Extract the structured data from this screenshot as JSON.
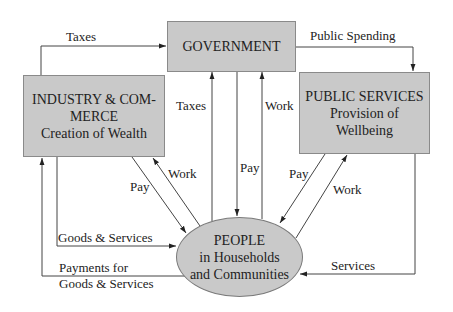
{
  "nodes": {
    "government": {
      "title": "GOVERNMENT"
    },
    "industry": {
      "line1": "INDUSTRY & COM-",
      "line2": "MERCE",
      "line3": "Creation of Wealth"
    },
    "public_services": {
      "line1": "PUBLIC SERVICES",
      "line2": "Provision of",
      "line3": "Wellbeing"
    },
    "people": {
      "line1": "PEOPLE",
      "line2": "in Households",
      "line3": "and Communities"
    }
  },
  "edges": {
    "industry_taxes": "Taxes",
    "public_spending": "Public Spending",
    "people_taxes": "Taxes",
    "gov_pay": "Pay",
    "people_work_gov": "Work",
    "industry_pay": "Pay",
    "industry_work": "Work",
    "ps_pay": "Pay",
    "ps_work": "Work",
    "goods_services": "Goods & Services",
    "payments_line1": "Payments for",
    "payments_line2": "Goods & Services",
    "services": "Services"
  },
  "colors": {
    "box_fill": "#c9c9c9",
    "box_border": "#8a8a8a",
    "line": "#333333",
    "text": "#222222"
  }
}
